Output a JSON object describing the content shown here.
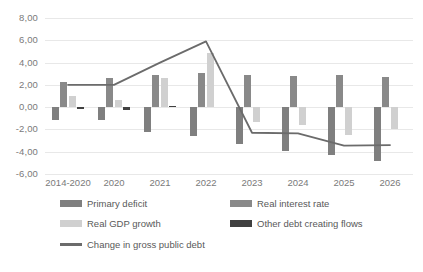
{
  "chart_data": {
    "type": "bar",
    "title": "",
    "subtitle": "",
    "xlabel": "",
    "ylabel": "",
    "ylim": [
      -6.0,
      8.0
    ],
    "ytick_step": 2.0,
    "grid": true,
    "decimal_separator": ",",
    "legend_position": "bottom",
    "categories": [
      "2014-2020",
      "2020",
      "2021",
      "2022",
      "2023",
      "2024",
      "2025",
      "2026"
    ],
    "ytick_labels": [
      "8,00",
      "6,00",
      "4,00",
      "2,00",
      "0,00",
      "-2,00",
      "-4,00",
      "-6,00"
    ],
    "ytick_values": [
      8,
      6,
      4,
      2,
      0,
      -2,
      -4,
      -6
    ],
    "series": [
      {
        "name": "Primary deficit",
        "type": "bar",
        "color": "#7f7f7f",
        "values": [
          -1.2,
          -1.2,
          -2.2,
          -2.6,
          -3.3,
          -3.9,
          -4.3,
          -4.8
        ]
      },
      {
        "name": "Real interest rate",
        "type": "bar",
        "color": "#898989",
        "values": [
          2.3,
          2.6,
          2.9,
          3.1,
          2.9,
          2.8,
          2.9,
          2.7
        ]
      },
      {
        "name": "Real GDP growth",
        "type": "bar",
        "color": "#d0d0d0",
        "values": [
          1.0,
          0.6,
          2.6,
          4.9,
          -1.3,
          -1.6,
          -2.5,
          -2.0
        ]
      },
      {
        "name": "Other debt creating flows",
        "type": "bar",
        "color": "#404040",
        "values": [
          -0.15,
          -0.25,
          0.1,
          0.0,
          0.0,
          0.0,
          0.0,
          0.0
        ]
      },
      {
        "name": "Change in gross public debt",
        "type": "line",
        "color": "#6b6b6b",
        "values": [
          2.0,
          2.0,
          4.0,
          5.9,
          -2.3,
          -2.35,
          -3.45,
          -3.4
        ]
      }
    ]
  },
  "legend": {
    "items": [
      {
        "label": "Primary deficit",
        "color": "#7f7f7f",
        "kind": "bar"
      },
      {
        "label": "Real interest rate",
        "color": "#898989",
        "kind": "bar"
      },
      {
        "label": "Real GDP growth",
        "color": "#d0d0d0",
        "kind": "bar"
      },
      {
        "label": "Other debt creating flows",
        "color": "#404040",
        "kind": "bar"
      },
      {
        "label": "Change in gross public debt",
        "color": "#6b6b6b",
        "kind": "line"
      }
    ]
  },
  "colors": {
    "gridline": "#e8e8e8",
    "axis_text": "#7a7a7a",
    "legend_text": "#595959",
    "background": "#ffffff"
  }
}
